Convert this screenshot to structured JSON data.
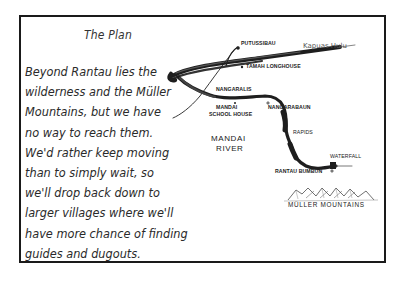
{
  "title": "The Plan",
  "paragraph_lines": [
    "Beyond Rantau lies the",
    "wilderness and the Müller",
    "Mountains, but we have",
    "no way to reach them.",
    "We'd rather keep moving",
    "than to simply wait, so",
    "we'll drop back down to",
    "larger villages where we'll",
    "have more chance of finding",
    "guides and dugouts."
  ],
  "map": {
    "labels": {
      "putussibau": "PUTUSSIBAU",
      "kapuas_hulu": "Kapuas Hulu",
      "tamah_longhouse": "TAMAH LONGHOUSE",
      "nanga_raalis": "NANGARALIS",
      "mandai_school_house_1": "MANDAI",
      "mandai_school_house_2": "SCHOOL HOUSE",
      "nanga_rabaun": "NANGARABAUN",
      "rapids": "RAPIDS",
      "mandai_river_1": "MANDAI",
      "mandai_river_2": "RIVER",
      "waterfall": "WATERFALL",
      "rantau_bumbun": "RANTAU BUMBUN",
      "muller_mountains": "MÜLLER MOUNTAINS"
    },
    "colors": {
      "ink": "#1a1a1a",
      "river": "#222222",
      "paper": "#ffffff"
    }
  }
}
